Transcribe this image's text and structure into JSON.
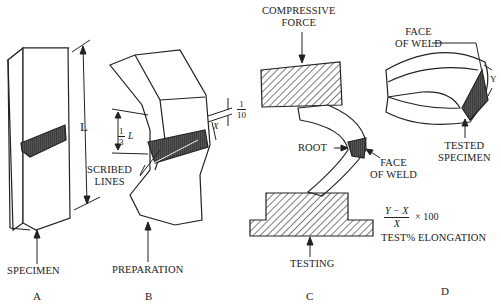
{
  "figure": {
    "panels": [
      {
        "id": "A",
        "letter": "A",
        "caption": "SPECIMEN",
        "dimension_label": "L"
      },
      {
        "id": "B",
        "letter": "B",
        "caption": "PREPARATION",
        "scribe_label_line1": "SCRIBED",
        "scribe_label_line2": "LINES",
        "third_num": "1",
        "third_den": "3",
        "third_var": "L",
        "tenth_num": "1",
        "tenth_den": "10",
        "x_var": "X"
      },
      {
        "id": "C",
        "letter": "C",
        "caption": "TESTING",
        "force_line1": "COMPRESSIVE",
        "force_line2": "FORCE",
        "root_label": "ROOT",
        "face_line1": "FACE",
        "face_line2": "OF WELD"
      },
      {
        "id": "D",
        "letter": "D",
        "face_line1": "FACE",
        "face_line2": "OF WELD",
        "tested_line1": "TESTED",
        "tested_line2": "SPECIMEN",
        "y_var": "Y",
        "formula_num": "Y − X",
        "formula_den": "X",
        "formula_mult": "× 100",
        "formula_caption": "TEST% ELONGATION"
      }
    ]
  }
}
